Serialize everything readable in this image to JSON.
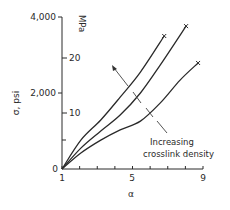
{
  "chart_data": {
    "type": "line",
    "title": "",
    "xlabel": "α",
    "ylabel": "σ, psi",
    "ylabel_right": "MPa",
    "xlim": [
      1,
      9
    ],
    "ylim": [
      0,
      4000
    ],
    "ylim_right_mpa": [
      0,
      27.6
    ],
    "x_ticks": [
      1,
      2,
      3,
      4,
      5,
      6,
      7,
      8,
      9
    ],
    "x_tick_labels": [
      "1",
      "5",
      "9"
    ],
    "y_ticks": [
      0,
      2000,
      4000
    ],
    "y_tick_labels": [
      "0",
      "2,000",
      "4,000"
    ],
    "y_right_ticks": [
      5,
      10,
      20
    ],
    "y_right_tick_labels": [
      "10",
      "20"
    ],
    "grid": false,
    "legend": null,
    "annotation": {
      "text_line1": "Increasing",
      "text_line2": "crosslink density",
      "arrow_direction": "up-left (toward upper curve)"
    },
    "series": [
      {
        "name": "highest crosslink density",
        "x": [
          1,
          2.07,
          3.2,
          4.3,
          5.45,
          6.8
        ],
        "y": [
          0,
          760,
          1290,
          1890,
          2550,
          3500
        ],
        "end_marker": "x"
      },
      {
        "name": "intermediate crosslink density",
        "x": [
          1,
          2.07,
          3.2,
          4.3,
          5.45,
          6.58,
          8.04
        ],
        "y": [
          0,
          550,
          1000,
          1420,
          2000,
          2740,
          3760
        ],
        "end_marker": "x"
      },
      {
        "name": "lowest crosslink density",
        "x": [
          1,
          2.07,
          3.2,
          4.3,
          5.45,
          6.58,
          7.7,
          8.72
        ],
        "y": [
          0,
          420,
          760,
          1030,
          1260,
          1740,
          2340,
          2790
        ],
        "end_marker": "x"
      }
    ]
  },
  "labels": {
    "y_left_title": "σ, psi",
    "y_right_title": "MPa",
    "x_title": "α",
    "y_tick_0": "0",
    "y_tick_2000": "2,000",
    "y_tick_4000": "4,000",
    "y_right_tick_10": "10",
    "y_right_tick_20": "20",
    "x_tick_1": "1",
    "x_tick_5": "5",
    "x_tick_9": "9",
    "annotation_line1": "Increasing",
    "annotation_line2": "crosslink density"
  },
  "style": {
    "line_color": "#2a2a2a",
    "background": "#ffffff"
  }
}
